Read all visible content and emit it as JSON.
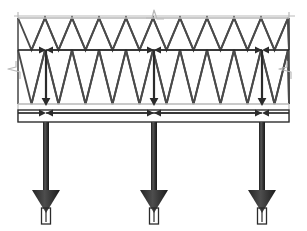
{
  "figure": {
    "width": 307,
    "height": 231,
    "background": "#ffffff"
  },
  "colors": {
    "structure_dark": "#3a3a3a",
    "lattice_stroke": "#4a4a4a",
    "guide_light": "#b9b9b9",
    "chord_line": "#2e2e2e",
    "arrow_fill": "#2b2b2b",
    "background": "#ffffff"
  },
  "geometry": {
    "truss": {
      "left": 18,
      "right": 289,
      "top_chord_y": 18,
      "mid_chord_y": 50,
      "bottom_chord_y": 104,
      "beam_top_y": 110,
      "beam_bottom_y": 122,
      "panel_pitch": 27,
      "half_pitch": 13.5
    },
    "columns": {
      "x_positions": [
        46,
        154,
        262
      ],
      "shaft_width": 6,
      "shaft_top_y": 122,
      "shaft_bottom_y": 190,
      "arrowhead_half_width": 14,
      "arrowhead_tip_y": 213,
      "base_plate_width": 9,
      "base_plate_top_y": 208,
      "base_plate_bottom_y": 224
    },
    "guides": {
      "left_vertical_x": 18,
      "right_vertical_x": 289,
      "guide_top_y": 12,
      "guide_bottom_y": 122,
      "top_horizontal_y": 16,
      "top_horizontal_x1": 14,
      "top_horizontal_x2": 295
    },
    "break_symbols": [
      {
        "name": "break-top-center",
        "x": 155,
        "y": 16,
        "orientation": "horizontal"
      },
      {
        "name": "break-left",
        "x": 18,
        "y": 70,
        "orientation": "vertical"
      },
      {
        "name": "break-right",
        "x": 289,
        "y": 70,
        "orientation": "vertical"
      }
    ]
  },
  "load_paths": {
    "mid_level": {
      "label": "horizontal reaction arrows at mid chord",
      "y": 50,
      "segments": [
        {
          "from_x": 18,
          "to_x": 46,
          "direction": "right"
        },
        {
          "from_x": 154,
          "to_x": 46,
          "direction": "left"
        },
        {
          "from_x": 46,
          "to_x": 154,
          "direction": "right"
        },
        {
          "from_x": 262,
          "to_x": 154,
          "direction": "left"
        },
        {
          "from_x": 154,
          "to_x": 262,
          "direction": "right"
        },
        {
          "from_x": 289,
          "to_x": 262,
          "direction": "left"
        }
      ]
    },
    "bottom_level": {
      "label": "horizontal reaction arrows at bottom chord",
      "y": 113,
      "segments": [
        {
          "from_x": 18,
          "to_x": 46,
          "direction": "right"
        },
        {
          "from_x": 154,
          "to_x": 46,
          "direction": "left"
        },
        {
          "from_x": 46,
          "to_x": 154,
          "direction": "right"
        },
        {
          "from_x": 262,
          "to_x": 154,
          "direction": "left"
        },
        {
          "from_x": 154,
          "to_x": 262,
          "direction": "right"
        },
        {
          "from_x": 289,
          "to_x": 262,
          "direction": "left"
        }
      ]
    },
    "verticals": {
      "label": "vertical load transfer from mid chord to bottom chord",
      "from_y": 50,
      "to_y": 106,
      "x_positions": [
        46,
        154,
        262
      ]
    },
    "column_loads": {
      "label": "downward column loads to foundations",
      "count": 3,
      "direction": "down"
    }
  },
  "chart_data": {
    "type": "diagram",
    "elements": [
      {
        "name": "top-chord",
        "type": "line",
        "y": 18
      },
      {
        "name": "mid-chord",
        "type": "line",
        "y": 50
      },
      {
        "name": "bottom-chord",
        "type": "line",
        "y": 104
      },
      {
        "name": "support-beam",
        "type": "band",
        "y1": 110,
        "y2": 122
      },
      {
        "name": "lattice-diagonals",
        "type": "zigzag",
        "pitch": 27
      },
      {
        "name": "columns",
        "type": "vertical-members",
        "count": 3
      },
      {
        "name": "load-arrows",
        "type": "arrows",
        "count": 15
      }
    ],
    "legend": [],
    "annotations": []
  }
}
